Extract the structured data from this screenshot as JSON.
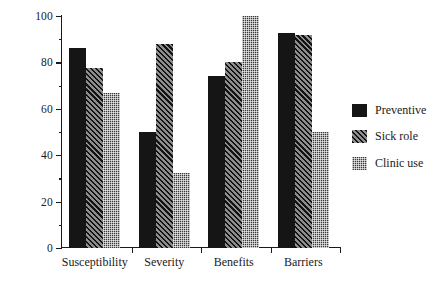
{
  "chart_data": {
    "type": "bar",
    "title": "",
    "subtitle": "",
    "xlabel": "",
    "ylabel": "Significance ratio (%)",
    "categories": [
      "Susceptibility",
      "Severity",
      "Benefits",
      "Barriers"
    ],
    "series": [
      {
        "name": "Preventive",
        "pattern": "solid",
        "color": "#151515",
        "values": [
          86,
          50,
          74,
          92.5
        ]
      },
      {
        "name": "Sick role",
        "pattern": "hatch",
        "color": "#2a2a2a",
        "values": [
          77.5,
          88,
          80,
          92
        ]
      },
      {
        "name": "Clinic use",
        "pattern": "stipple",
        "color": "#3a3a3a",
        "values": [
          67,
          32.5,
          100,
          50
        ]
      }
    ],
    "ylim": [
      0,
      100
    ],
    "ytick_labels": [
      "0",
      "20",
      "40",
      "60",
      "80",
      "100"
    ],
    "ytick_values": [
      0,
      20,
      40,
      60,
      80,
      100
    ],
    "yminor_values": [
      10,
      30,
      50,
      70,
      90
    ],
    "grid": false,
    "legend_position": "right"
  },
  "axis": {
    "y_title": "Significance ratio (%)"
  },
  "legend": {
    "entries": [
      {
        "label": "Preventive"
      },
      {
        "label": "Sick role"
      },
      {
        "label": "Clinic use"
      }
    ]
  }
}
